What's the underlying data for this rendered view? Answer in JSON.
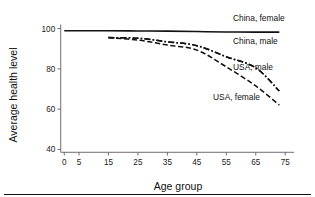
{
  "chart_data": {
    "type": "line",
    "title": "",
    "xlabel": "Age group",
    "ylabel": "Average health level",
    "xlim": [
      -4,
      79
    ],
    "ylim": [
      38,
      102
    ],
    "xticks": [
      0,
      5,
      15,
      25,
      35,
      45,
      55,
      65,
      75
    ],
    "xtick_labels": [
      "0",
      "5",
      "15",
      "25",
      "35",
      "45",
      "55",
      "65",
      "75"
    ],
    "yticks": [
      40,
      60,
      80,
      100
    ],
    "ytick_labels": [
      "40",
      "60",
      "80",
      "100"
    ],
    "grid": false,
    "legend_position": "inline-right",
    "series": [
      {
        "name": "China, female",
        "style": "solid",
        "x": [
          0,
          5,
          15,
          25,
          35,
          45,
          55,
          65,
          73
        ],
        "values": [
          98.9,
          98.9,
          98.9,
          98.8,
          98.7,
          98.5,
          98.3,
          98.2,
          98.2
        ]
      },
      {
        "name": "China, male",
        "style": "dash-dot",
        "x": [
          15,
          25,
          35,
          45,
          55,
          65,
          73
        ],
        "values": [
          95.5,
          95.2,
          93.4,
          91.5,
          86.0,
          80.5,
          69.0
        ]
      },
      {
        "name": "USA, male",
        "style": "dash-dot",
        "x": [
          15,
          25,
          35,
          45,
          55,
          65,
          73
        ],
        "values": [
          95.5,
          95.2,
          93.4,
          91.5,
          86.0,
          80.5,
          69.0
        ]
      },
      {
        "name": "USA, female",
        "style": "dashed",
        "x": [
          15,
          25,
          35,
          45,
          55,
          65,
          73
        ],
        "values": [
          95.4,
          94.3,
          91.8,
          89.3,
          81.0,
          71.5,
          62.0
        ]
      }
    ],
    "annotations": [
      {
        "name": "China, female",
        "x_px": 233,
        "y_px": 21
      },
      {
        "name": "China, male",
        "x_px": 233,
        "y_px": 44
      },
      {
        "name": "USA, male",
        "x_px": 233,
        "y_px": 70
      },
      {
        "name": "USA, female",
        "x_px": 213,
        "y_px": 100
      }
    ]
  },
  "figure": {
    "axis_title_x": "Age group",
    "axis_title_y": "Average health level"
  }
}
